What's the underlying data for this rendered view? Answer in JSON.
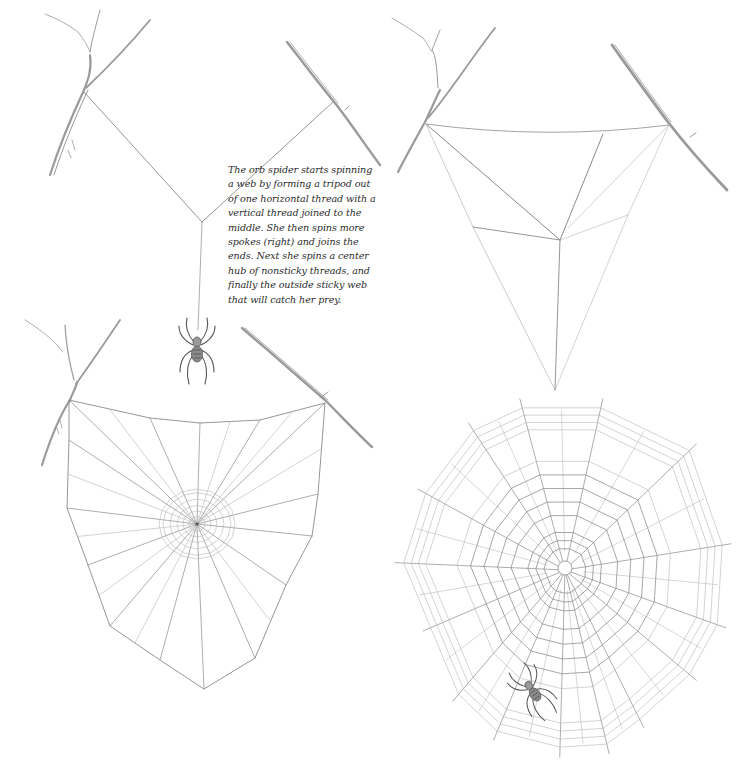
{
  "caption": {
    "lines": [
      "The orb spider starts spinning",
      "a web by forming a tripod out",
      "of one horizontal thread with a",
      "vertical thread joined to the",
      "middle. She then spins more",
      "spokes (right) and joins the",
      "ends. Next she spins a center",
      "hub of nonsticky threads, and",
      "finally the outside sticky web",
      "that will catch her prey."
    ]
  },
  "colors": {
    "background": "#ffffff",
    "thread": "#8a8a8a",
    "thread_light": "#b5b5b5",
    "twig": "#9a9a9a",
    "spider": "#555555",
    "text": "#2b2b2b"
  },
  "panels": [
    {
      "id": "tripod",
      "stage": 1,
      "description": "Tripod: horizontal-ish threads joined to a vertical drop line with hanging spider",
      "anchors": {
        "left": [
          84,
          92
        ],
        "right": [
          333,
          102
        ],
        "junction": [
          202,
          222
        ]
      },
      "drop_line_end": [
        198,
        330
      ],
      "spider": {
        "x": 197,
        "y": 348,
        "scale": 1.0,
        "rotate": 0
      }
    },
    {
      "id": "spokes",
      "stage": 2,
      "description": "More spokes added and ends joined",
      "frame": [
        [
          426,
          124
        ],
        [
          603,
          134
        ],
        [
          669,
          125
        ]
      ],
      "hub": [
        560,
        240
      ],
      "points": [
        [
          473,
          227
        ],
        [
          555,
          390
        ],
        [
          628,
          215
        ]
      ]
    },
    {
      "id": "hub",
      "stage": 3,
      "description": "Frame with radial spokes and central nonsticky hub",
      "frame": [
        [
          69,
          400
        ],
        [
          150,
          418
        ],
        [
          200,
          423
        ],
        [
          260,
          420
        ],
        [
          325,
          403
        ],
        [
          318,
          494
        ],
        [
          312,
          536
        ],
        [
          286,
          585
        ],
        [
          255,
          658
        ],
        [
          204,
          689
        ],
        [
          160,
          660
        ],
        [
          110,
          626
        ],
        [
          88,
          565
        ],
        [
          67,
          508
        ],
        [
          69,
          440
        ]
      ],
      "hub": [
        197,
        524
      ],
      "hub_rings": [
        8,
        14,
        20,
        27,
        34,
        38
      ]
    },
    {
      "id": "sticky",
      "stage": 4,
      "description": "Completed orb web with sticky spiral and spider",
      "hub": [
        565,
        570
      ],
      "outer": [
        [
          522,
          407
        ],
        [
          601,
          407
        ],
        [
          690,
          450
        ],
        [
          723,
          545
        ],
        [
          718,
          625
        ],
        [
          690,
          675
        ],
        [
          640,
          720
        ],
        [
          607,
          745
        ],
        [
          560,
          748
        ],
        [
          497,
          732
        ],
        [
          458,
          695
        ],
        [
          430,
          628
        ],
        [
          403,
          563
        ],
        [
          425,
          493
        ],
        [
          473,
          430
        ]
      ],
      "spiral_count": 12,
      "spider": {
        "x": 532,
        "y": 690,
        "scale": 0.9,
        "rotate": -35
      }
    }
  ]
}
